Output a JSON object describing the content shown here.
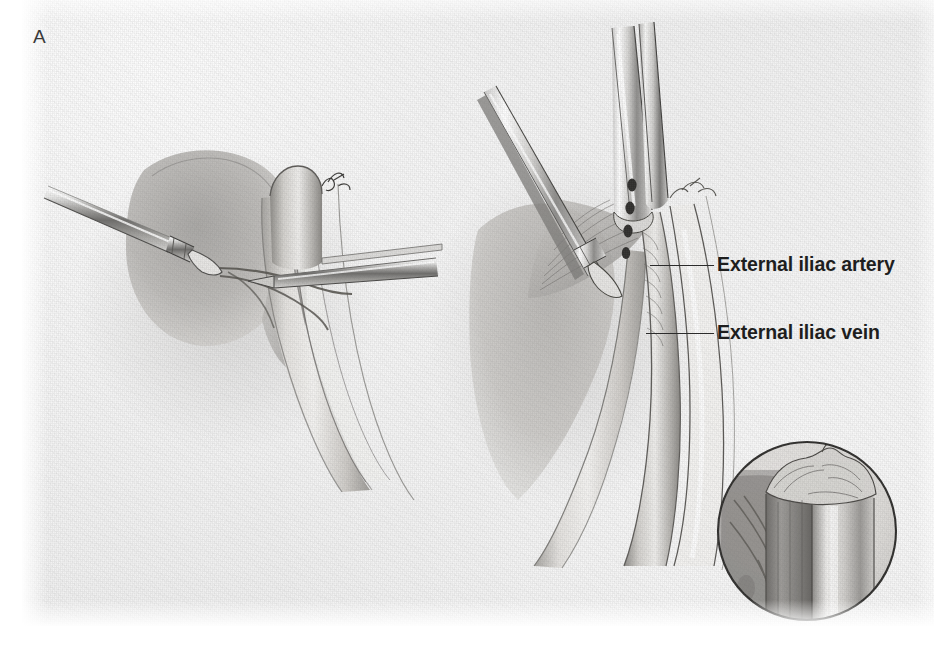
{
  "figure": {
    "panel_letter": "A",
    "domain_kind": "surgical-illustration",
    "background_color": "#f1f1f1",
    "ink_color": "#2b2b2b"
  },
  "labels": {
    "artery": "External iliac artery",
    "vein": "External iliac vein"
  },
  "panels": {
    "left": {
      "name": "left-illustration",
      "description": "Laparoscopic grasper entering from the left retracting tissue while a second instrument crosses the vessel"
    },
    "right": {
      "name": "right-illustration",
      "description": "Two laparoscopic instruments converging on the external iliac vessels; the upper instrument is a clip applier with four markings"
    },
    "inset": {
      "name": "inset-detail",
      "description": "Circular magnified inset showing the transected vessel stump"
    }
  },
  "colors": {
    "paper": "#f1f1f1",
    "tissue_light": "#e3e1de",
    "tissue_mid": "#b8b6b2",
    "tissue_dark": "#8d8b88",
    "shadow": "#9a9895",
    "steel_light": "#f4f4f3",
    "steel_mid": "#b0afad",
    "steel_dark": "#595856",
    "outline": "#4a4947"
  }
}
